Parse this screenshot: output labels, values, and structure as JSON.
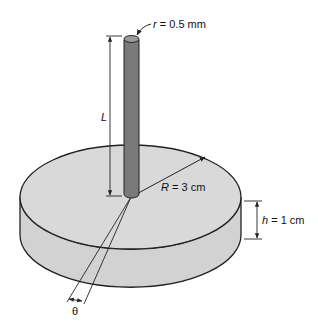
{
  "figure": {
    "labels": {
      "rod_radius_var": "r",
      "rod_radius_val": " = 0.5 mm",
      "length_var": "L",
      "disk_radius_var": "R",
      "disk_radius_val": " = 3 cm",
      "height_var": "h",
      "height_val": " = 1 cm",
      "angle_var": "θ"
    },
    "colors": {
      "disk_fill": "#d9d9d9",
      "disk_side_fill": "#d2d2d2",
      "rod_fill": "#7a7a7a",
      "rod_top_fill": "#9a9a9a",
      "stroke": "#222222"
    }
  }
}
